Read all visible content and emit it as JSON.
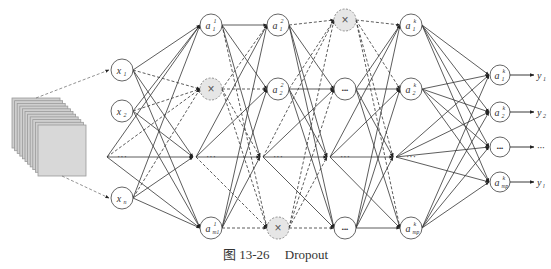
{
  "caption": {
    "figure_label": "图 13-26",
    "title": "Dropout"
  },
  "colors": {
    "line": "#333333",
    "dropped_fill": "#e6e6e6",
    "node_stroke": "#555555",
    "image_stack": "#cfcfcf"
  },
  "layers": [
    {
      "id": "input",
      "x": 122,
      "nodes": [
        {
          "y": 70,
          "label": "x",
          "sub": "1",
          "sup": ""
        },
        {
          "y": 111,
          "label": "x",
          "sub": "2",
          "sup": ""
        },
        {
          "y": 157,
          "type": "ellipsis"
        },
        {
          "y": 198,
          "label": "x",
          "sub": "n",
          "sup": ""
        }
      ]
    },
    {
      "id": "hidden1",
      "x": 211,
      "nodes": [
        {
          "y": 25,
          "label": "a",
          "sub": "1",
          "sup": "1"
        },
        {
          "y": 89,
          "type": "dropped"
        },
        {
          "y": 157,
          "type": "ellipsis"
        },
        {
          "y": 228,
          "label": "a",
          "sub": "m1",
          "sup": "1"
        }
      ]
    },
    {
      "id": "hidden2",
      "x": 278,
      "nodes": [
        {
          "y": 25,
          "label": "a",
          "sub": "1",
          "sup": "2"
        },
        {
          "y": 89,
          "label": "a",
          "sub": "2",
          "sup": "2"
        },
        {
          "y": 157,
          "type": "ellipsis"
        },
        {
          "y": 228,
          "type": "dropped"
        }
      ]
    },
    {
      "id": "hidden3",
      "x": 345,
      "nodes": [
        {
          "y": 20,
          "type": "dropped"
        },
        {
          "y": 89,
          "type": "dots"
        },
        {
          "y": 157,
          "type": "ellipsis"
        },
        {
          "y": 228,
          "type": "dots"
        }
      ]
    },
    {
      "id": "hidden4",
      "x": 411,
      "nodes": [
        {
          "y": 25,
          "label": "a",
          "sub": "1",
          "sup": "k"
        },
        {
          "y": 89,
          "label": "a",
          "sub": "2",
          "sup": "k"
        },
        {
          "y": 157,
          "type": "ellipsis"
        },
        {
          "y": 228,
          "label": "a",
          "sub": "mp",
          "sup": "k"
        }
      ]
    },
    {
      "id": "output",
      "x": 500,
      "nodes": [
        {
          "y": 75,
          "label": "a",
          "sub": "1",
          "sup": "k"
        },
        {
          "y": 112,
          "label": "a",
          "sub": "2",
          "sup": "k"
        },
        {
          "y": 147,
          "type": "dots"
        },
        {
          "y": 182,
          "label": "a",
          "sub": "mp",
          "sup": "k"
        }
      ]
    }
  ],
  "outputs": [
    {
      "y": 75,
      "label": "y",
      "sub": "1"
    },
    {
      "y": 112,
      "label": "y",
      "sub": "2"
    },
    {
      "y": 147,
      "label": "···",
      "sub": ""
    },
    {
      "y": 182,
      "label": "y",
      "sub": "l"
    }
  ],
  "ellipsis_text": "···",
  "dropped_symbol": "×"
}
